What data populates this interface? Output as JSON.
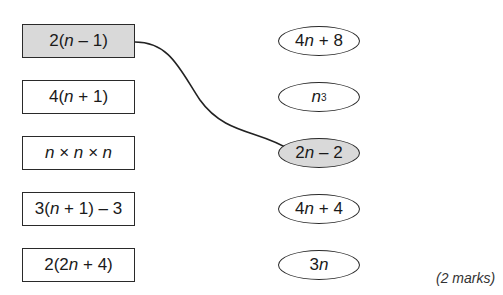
{
  "left_boxes": [
    {
      "pre": "2(",
      "var": "n",
      "post": " – 1)",
      "shaded": true,
      "top": 24
    },
    {
      "pre": "4(",
      "var": "n",
      "post": " + 1)",
      "shaded": false,
      "top": 80
    },
    {
      "pre": "",
      "var": "n × n × n",
      "post": "",
      "shaded": false,
      "top": 136
    },
    {
      "pre": "3(",
      "var": "n",
      "post": " + 1) – 3",
      "shaded": false,
      "top": 192
    },
    {
      "pre": "2(2",
      "var": "n",
      "post": " + 4)",
      "shaded": false,
      "top": 248
    }
  ],
  "right_ovals": [
    {
      "pre": "4",
      "var": "n",
      "post": " + 8",
      "sup": "",
      "shaded": false,
      "top": 26
    },
    {
      "pre": "",
      "var": "n",
      "post": "",
      "sup": "3",
      "shaded": false,
      "top": 82
    },
    {
      "pre": "2",
      "var": "n",
      "post": " – 2",
      "sup": "",
      "shaded": true,
      "top": 138
    },
    {
      "pre": "4",
      "var": "n",
      "post": " + 4",
      "sup": "",
      "shaded": false,
      "top": 194
    },
    {
      "pre": "3",
      "var": "n",
      "post": "",
      "sup": "",
      "shaded": false,
      "top": 250
    }
  ],
  "connection": {
    "from_box": 0,
    "to_oval": 2
  },
  "marks_label": "(2 marks)"
}
